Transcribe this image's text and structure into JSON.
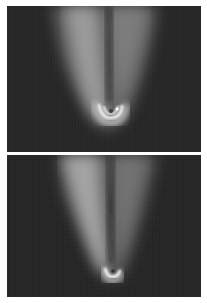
{
  "figure": {
    "panels": [
      {
        "id": "top",
        "description": "Grayscale emission plume with bright U-shaped core near lower center",
        "background_color": "#262626",
        "core_color": "#f0f0f0",
        "plume_color": "#9a9a9a"
      },
      {
        "id": "bottom",
        "description": "Grayscale emission plume, narrower, with bright hook-shaped core near bottom center",
        "background_color": "#262626",
        "core_color": "#f0f0f0",
        "plume_color": "#9a9a9a"
      }
    ]
  }
}
